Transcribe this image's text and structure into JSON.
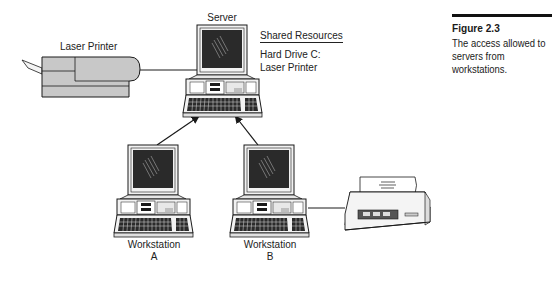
{
  "figure": {
    "number_label": "Figure 2.3",
    "caption": "The access allowed to servers from workstations."
  },
  "nodes": {
    "laser_printer": {
      "label": "Laser Printer"
    },
    "server": {
      "label": "Server"
    },
    "workstation_a": {
      "label_line1": "Workstation",
      "label_line2": "A"
    },
    "workstation_b": {
      "label_line1": "Workstation",
      "label_line2": "B"
    },
    "local_printer": {
      "label": ""
    }
  },
  "shared_resources": {
    "heading": "Shared Resources",
    "items": [
      "Hard Drive C:",
      "Laser Printer"
    ]
  },
  "edges": [
    {
      "from": "laser_printer",
      "to": "server",
      "type": "line"
    },
    {
      "from": "workstation_a",
      "to": "server",
      "type": "arrow"
    },
    {
      "from": "workstation_b",
      "to": "server",
      "type": "arrow"
    },
    {
      "from": "workstation_b",
      "to": "local_printer",
      "type": "line"
    }
  ],
  "colors": {
    "stroke": "#1a1a1a",
    "screen": "#2a2a2a",
    "device_fill": "#f2f2f2",
    "printer_fill": "#c8c8c8"
  }
}
